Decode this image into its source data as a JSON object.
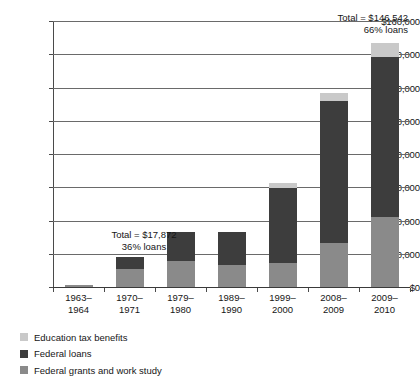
{
  "chart_data": {
    "type": "bar",
    "title": "",
    "subtitle": "",
    "xlabel": "",
    "ylabel": "",
    "stacked": true,
    "grid": true,
    "legend_position": "bottom-left",
    "ylim": [
      0,
      160000
    ],
    "yticks": [
      0,
      20000,
      40000,
      60000,
      80000,
      100000,
      120000,
      140000,
      160000
    ],
    "ytick_labels": [
      "$0",
      "20,000",
      "40,000",
      "60,000",
      "80,000",
      "100,000",
      "120,000",
      "140,000",
      "$160,000"
    ],
    "categories": [
      "1963–\n1964",
      "1970–\n1971",
      "1979–\n1980",
      "1989–\n1990",
      "1999–\n2000",
      "2008–\n2009",
      "2009–\n2010"
    ],
    "category_lines": [
      [
        "1963–",
        "1964"
      ],
      [
        "1970–",
        "1971"
      ],
      [
        "1979–",
        "1980"
      ],
      [
        "1989–",
        "1990"
      ],
      [
        "1999–",
        "2000"
      ],
      [
        "2008–",
        "2009"
      ],
      [
        "2009–",
        "2010"
      ]
    ],
    "series": [
      {
        "name": "Federal grants and work study",
        "color": "#8a8a8a",
        "values": [
          1100,
          11000,
          15500,
          13500,
          14500,
          26500,
          42000
        ]
      },
      {
        "name": "Federal loans",
        "color": "#3d3d3d",
        "values": [
          400,
          6872,
          17500,
          19500,
          45000,
          85500,
          96500
        ]
      },
      {
        "name": "Education tax benefits",
        "color": "#c9c9c9",
        "values": [
          0,
          0,
          0,
          0,
          3000,
          5000,
          8042
        ]
      }
    ],
    "totals": [
      1500,
      17872,
      33000,
      33000,
      62500,
      117000,
      146542
    ],
    "annotations": [
      {
        "id": "annotation-last-bar",
        "lines": [
          "Total = $146,542",
          "66% loans"
        ],
        "align": "right"
      },
      {
        "id": "annotation-second-bar",
        "lines": [
          "Total = $17,872",
          "36% loans"
        ],
        "align": "center"
      }
    ]
  },
  "legend": {
    "items": [
      {
        "label": "Education tax benefits",
        "color": "#c9c9c9"
      },
      {
        "label": "Federal loans",
        "color": "#3d3d3d"
      },
      {
        "label": "Federal grants and work study",
        "color": "#8a8a8a"
      }
    ]
  }
}
